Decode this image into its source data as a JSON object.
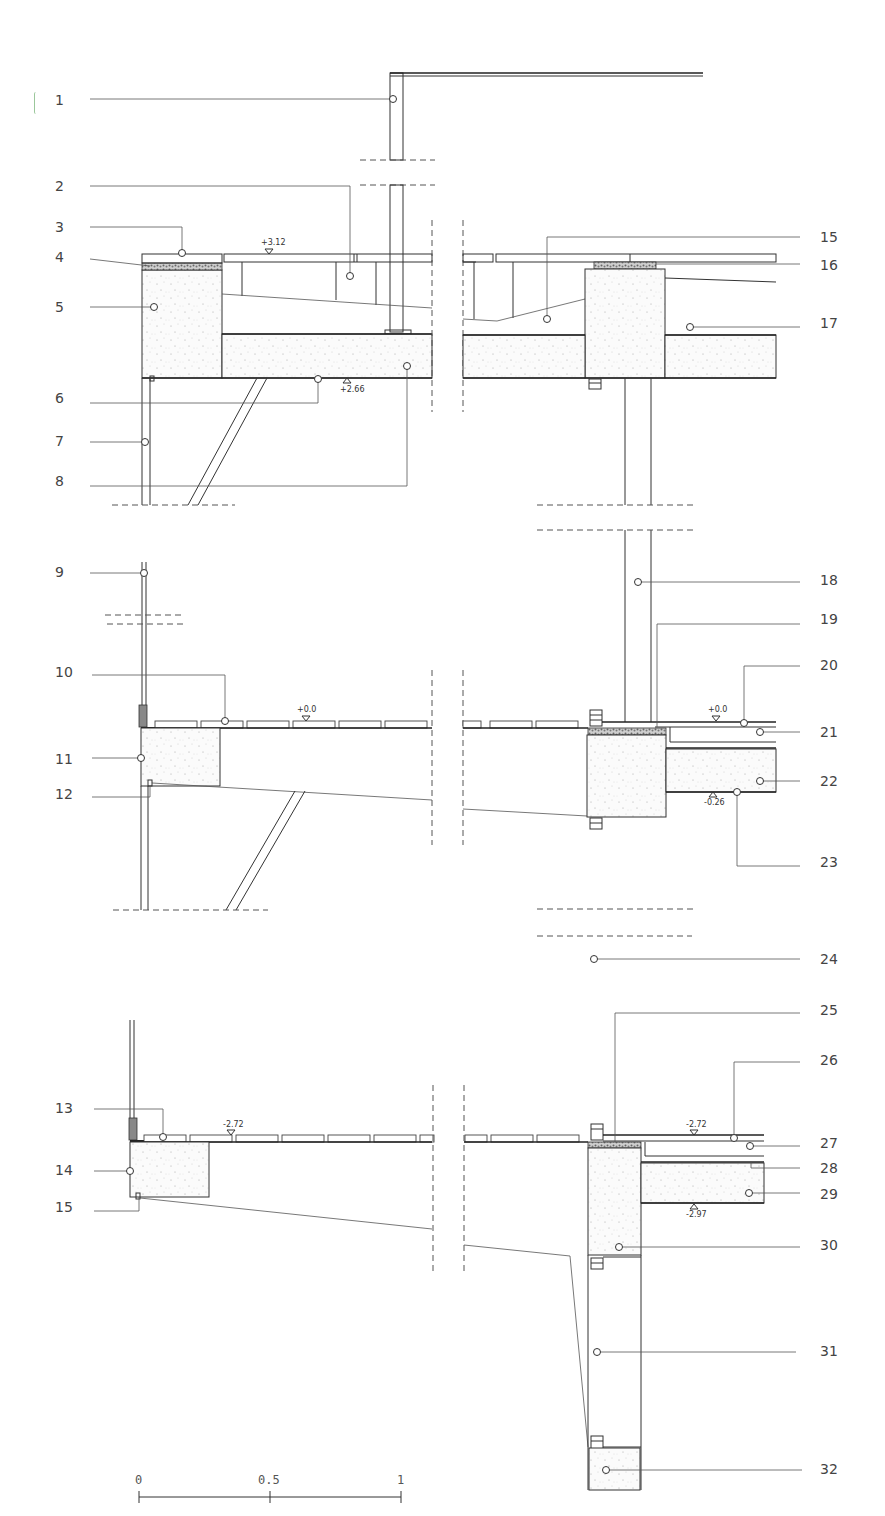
{
  "drawing": {
    "type": "architectural-section-detail",
    "callouts": [
      {
        "num": "1",
        "x": 55,
        "y": 100
      },
      {
        "num": "2",
        "x": 55,
        "y": 186
      },
      {
        "num": "3",
        "x": 55,
        "y": 227
      },
      {
        "num": "4",
        "x": 55,
        "y": 257
      },
      {
        "num": "5",
        "x": 55,
        "y": 307
      },
      {
        "num": "6",
        "x": 55,
        "y": 398
      },
      {
        "num": "7",
        "x": 55,
        "y": 441
      },
      {
        "num": "8",
        "x": 55,
        "y": 481
      },
      {
        "num": "9",
        "x": 55,
        "y": 572
      },
      {
        "num": "10",
        "x": 55,
        "y": 672
      },
      {
        "num": "11",
        "x": 55,
        "y": 759
      },
      {
        "num": "12",
        "x": 55,
        "y": 794
      },
      {
        "num": "13",
        "x": 55,
        "y": 1108
      },
      {
        "num": "14",
        "x": 55,
        "y": 1170
      },
      {
        "num": "15",
        "x": 55,
        "y": 1207
      },
      {
        "num": "15",
        "x": 820,
        "y": 237
      },
      {
        "num": "16",
        "x": 820,
        "y": 265
      },
      {
        "num": "17",
        "x": 820,
        "y": 323
      },
      {
        "num": "18",
        "x": 820,
        "y": 580
      },
      {
        "num": "19",
        "x": 820,
        "y": 619
      },
      {
        "num": "20",
        "x": 820,
        "y": 665
      },
      {
        "num": "21",
        "x": 820,
        "y": 732
      },
      {
        "num": "22",
        "x": 820,
        "y": 781
      },
      {
        "num": "23",
        "x": 820,
        "y": 862
      },
      {
        "num": "24",
        "x": 820,
        "y": 959
      },
      {
        "num": "25",
        "x": 820,
        "y": 1010
      },
      {
        "num": "26",
        "x": 820,
        "y": 1060
      },
      {
        "num": "27",
        "x": 820,
        "y": 1143
      },
      {
        "num": "28",
        "x": 820,
        "y": 1168
      },
      {
        "num": "29",
        "x": 820,
        "y": 1194
      },
      {
        "num": "30",
        "x": 820,
        "y": 1245
      },
      {
        "num": "31",
        "x": 820,
        "y": 1351
      },
      {
        "num": "32",
        "x": 820,
        "y": 1469
      }
    ],
    "levels": [
      {
        "text": "+3.12",
        "x": 261,
        "y": 239
      },
      {
        "text": "+2.66",
        "x": 340,
        "y": 386
      },
      {
        "text": "+0.0",
        "x": 297,
        "y": 706
      },
      {
        "text": "+0.0",
        "x": 708,
        "y": 706
      },
      {
        "text": "-0.26",
        "x": 704,
        "y": 797
      },
      {
        "text": "-2.72",
        "x": 223,
        "y": 1121
      },
      {
        "text": "-2.72",
        "x": 686,
        "y": 1121
      },
      {
        "text": "-2.97",
        "x": 686,
        "y": 1211
      }
    ],
    "scale_bar": {
      "labels": [
        "0",
        "0.5",
        "1"
      ],
      "unit_note": "m"
    },
    "colors": {
      "line": "#333333",
      "background": "#ffffff",
      "text": "#444444"
    }
  }
}
